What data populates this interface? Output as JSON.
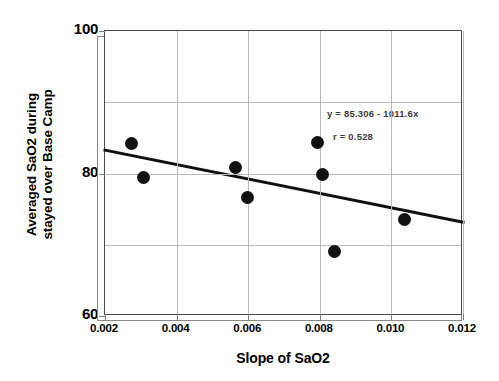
{
  "chart_data": {
    "type": "scatter",
    "title": "",
    "xlabel": "Slope of SaO2",
    "ylabel_line1": "Averaged SaO2 during",
    "ylabel_line2": "stayed over Base Camp",
    "xlim": [
      0.002,
      0.012
    ],
    "ylim": [
      60,
      100
    ],
    "xticks": [
      "0.002",
      "0.004",
      "0.006",
      "0.008",
      "0.010",
      "0.012"
    ],
    "xtick_values": [
      0.002,
      0.004,
      0.006,
      0.008,
      0.01,
      0.012
    ],
    "yticks": [
      "100",
      "80",
      "60"
    ],
    "ytick_values": [
      100,
      80,
      60
    ],
    "y_gridline_values": [
      100,
      90,
      80,
      70,
      60
    ],
    "grid": true,
    "legend": "none",
    "marker_color": "#111111",
    "trendline_color": "#111111",
    "points": [
      {
        "x": 0.00274,
        "y": 84.2
      },
      {
        "x": 0.00307,
        "y": 79.5
      },
      {
        "x": 0.00565,
        "y": 80.9
      },
      {
        "x": 0.00598,
        "y": 76.6
      },
      {
        "x": 0.00793,
        "y": 84.4
      },
      {
        "x": 0.00807,
        "y": 79.8
      },
      {
        "x": 0.0084,
        "y": 69.1
      },
      {
        "x": 0.01036,
        "y": 73.6
      }
    ],
    "trendline": {
      "equation": "y = 85.306 - 1011.6x",
      "r_text": "r = 0.528",
      "intercept": 85.306,
      "slope": -1011.6,
      "r": 0.528,
      "x_start": 0.002,
      "x_end": 0.012,
      "y_start": 83.28,
      "y_end": 73.17
    },
    "annotations": [
      {
        "text": "y = 85.306 - 1011.6x"
      },
      {
        "text": "r = 0.528"
      }
    ]
  }
}
